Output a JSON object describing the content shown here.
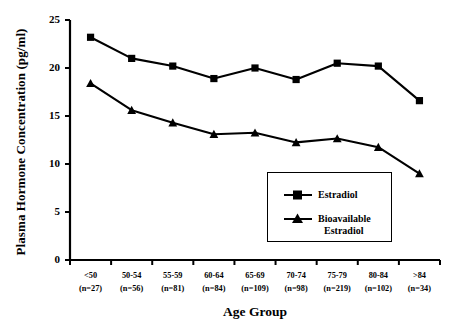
{
  "chart_data": {
    "type": "line",
    "title": "",
    "xlabel": "Age Group",
    "ylabel": "Plasma Hormone Concentration (pg/ml)",
    "ylim": [
      0,
      25
    ],
    "yticks": [
      0,
      5,
      10,
      15,
      20,
      25
    ],
    "grid": false,
    "legend_position": "inside-lower-right",
    "categories": [
      "<50",
      "50-54",
      "55-59",
      "60-64",
      "65-69",
      "70-74",
      "75-79",
      "80-84",
      ">84"
    ],
    "category_counts": [
      "(n=27)",
      "(n=56)",
      "(n=81)",
      "(n=84)",
      "(n=109)",
      "(n=98)",
      "(n=219)",
      "(n=102)",
      "(n=34)"
    ],
    "series": [
      {
        "name": "Estradiol",
        "marker": "square",
        "color": "#000000",
        "values": [
          23.2,
          21.0,
          20.2,
          18.9,
          20.0,
          18.8,
          20.5,
          20.2,
          16.6
        ]
      },
      {
        "name": "Bioavailable Estradiol",
        "marker": "triangle",
        "color": "#000000",
        "values": [
          18.4,
          15.6,
          14.3,
          13.1,
          13.25,
          12.25,
          12.65,
          11.75,
          9.0
        ]
      }
    ]
  },
  "legend": {
    "entries": [
      {
        "label": "Estradiol",
        "label_line2": ""
      },
      {
        "label": "Bioavailable",
        "label_line2": "Estradiol"
      }
    ]
  },
  "axes": {
    "y_axis_title": "Plasma Hormone Concentration (pg/ml)",
    "x_axis_title": "Age Group"
  }
}
